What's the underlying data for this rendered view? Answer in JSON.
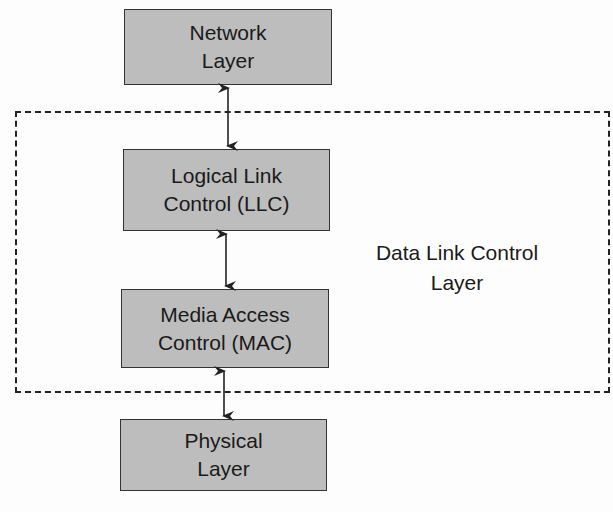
{
  "diagram": {
    "boxes": [
      {
        "id": "network",
        "line1": "Network",
        "line2": "Layer"
      },
      {
        "id": "llc",
        "line1": "Logical Link",
        "line2": "Control (LLC)"
      },
      {
        "id": "mac",
        "line1": "Media Access",
        "line2": "Control (MAC)"
      },
      {
        "id": "physical",
        "line1": "Physical",
        "line2": "Layer"
      }
    ],
    "group_label": {
      "line1": "Data Link Control",
      "line2": "Layer"
    },
    "colors": {
      "box_fill": "#bdbdbd",
      "border": "#333333",
      "background": "#fdfdfd"
    }
  }
}
